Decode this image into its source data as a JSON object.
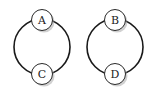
{
  "diagram": {
    "type": "two disconnected cycle graphs",
    "components": [
      {
        "id": "left",
        "ring": {
          "cx": 42,
          "cy": 47,
          "r": 28
        },
        "nodes": [
          {
            "label": "A",
            "cx": 42,
            "cy": 20
          },
          {
            "label": "C",
            "cx": 42,
            "cy": 74
          }
        ]
      },
      {
        "id": "right",
        "ring": {
          "cx": 115,
          "cy": 47,
          "r": 28
        },
        "nodes": [
          {
            "label": "B",
            "cx": 115,
            "cy": 20
          },
          {
            "label": "D",
            "cx": 115,
            "cy": 74
          }
        ]
      }
    ],
    "edges": [
      [
        "A",
        "C"
      ],
      [
        "C",
        "A"
      ],
      [
        "B",
        "D"
      ],
      [
        "D",
        "B"
      ]
    ],
    "colors": {
      "stroke": "#1a1a1a",
      "node_fill": "#ffffff",
      "shadow": "#9a9a9a"
    }
  }
}
